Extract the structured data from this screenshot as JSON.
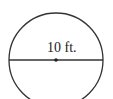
{
  "diagram": {
    "shape": "circle",
    "diameter_label": "10 ft.",
    "stroke_color": "#333333",
    "has_center_point": true,
    "has_diameter_line": true
  }
}
